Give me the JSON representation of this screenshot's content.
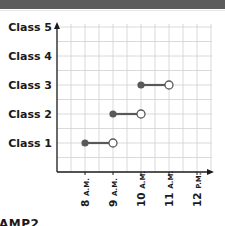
{
  "header": {
    "bar_color": "#5c5c5c"
  },
  "chart_data": {
    "type": "line",
    "subtype": "interval-segments",
    "title": "",
    "xlabel": "",
    "ylabel": "",
    "categories": [
      "Class 1",
      "Class 2",
      "Class 3",
      "Class 4",
      "Class 5"
    ],
    "x_ticks": [
      "8 A.M.",
      "9 A.M.",
      "10 A.M.",
      "11 A.M.",
      "12 P.M."
    ],
    "x_tick_parts": [
      {
        "num": "8",
        "suffix": "A.M."
      },
      {
        "num": "9",
        "suffix": "A.M."
      },
      {
        "num": "10",
        "suffix": "A.M."
      },
      {
        "num": "11",
        "suffix": "A.M."
      },
      {
        "num": "12",
        "suffix": "P.M."
      }
    ],
    "xlim": [
      7,
      12.5
    ],
    "grid": true,
    "grid_step_hours": 0.5,
    "series": [
      {
        "name": "Class 1",
        "start": 8,
        "end": 9,
        "start_marker": "closed",
        "end_marker": "open"
      },
      {
        "name": "Class 2",
        "start": 9,
        "end": 10,
        "start_marker": "closed",
        "end_marker": "open"
      },
      {
        "name": "Class 3",
        "start": 10,
        "end": 11,
        "start_marker": "closed",
        "end_marker": "open"
      },
      {
        "name": "Class 4",
        "start": null,
        "end": null
      },
      {
        "name": "Class 5",
        "start": null,
        "end": null
      }
    ],
    "colors": {
      "segment": "#595959",
      "grid": "#d0d0d0",
      "axis": "#1a1a1a",
      "open_fill": "#ffffff"
    }
  },
  "footer": {
    "partial_text": "AMP2"
  }
}
